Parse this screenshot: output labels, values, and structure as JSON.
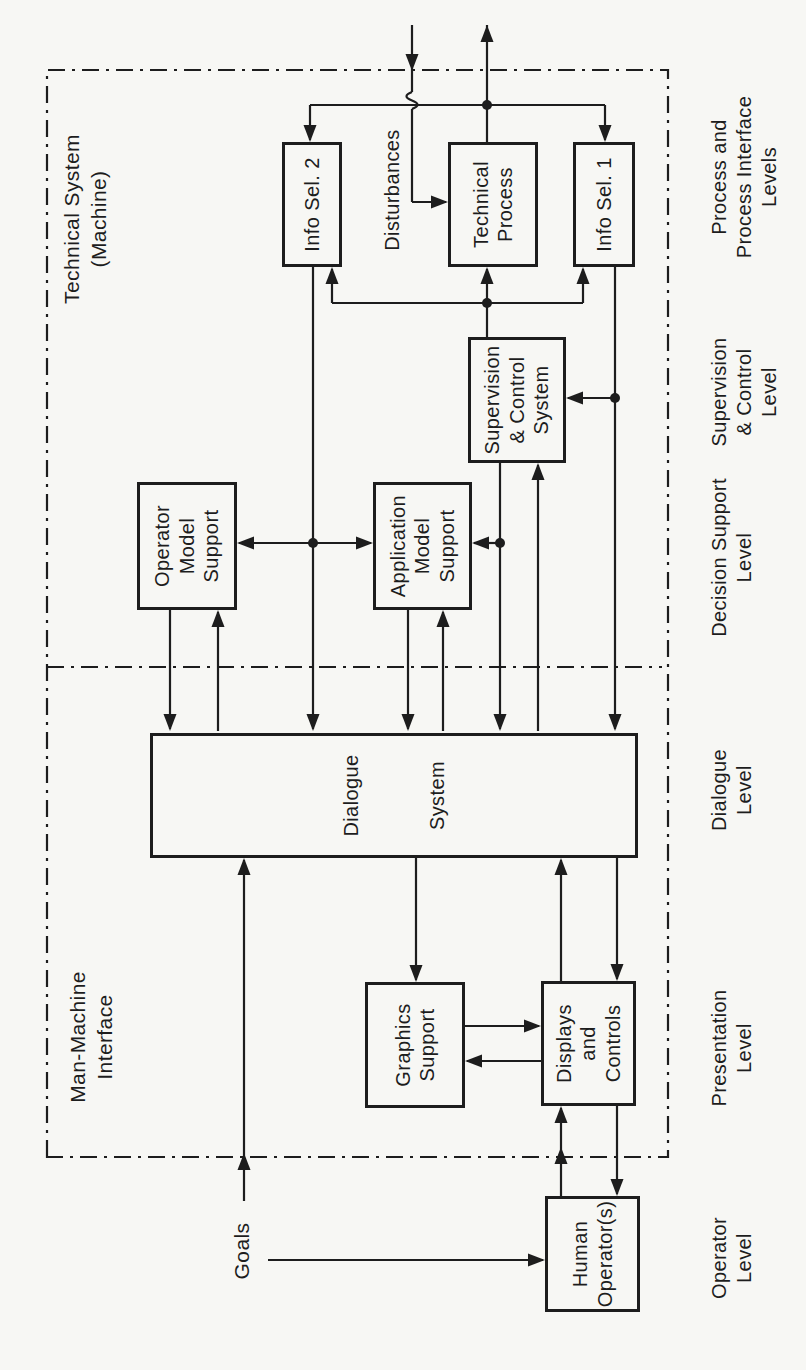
{
  "diagram": {
    "title_regions": {
      "man_machine_interface": {
        "lines": [
          "Man-Machine",
          "Interface"
        ]
      },
      "technical_system": {
        "lines": [
          "Technical  System",
          "(Machine)"
        ]
      }
    },
    "external_labels": {
      "goals": "Goals",
      "disturbances": "Disturbances"
    },
    "boxes": {
      "human_operator": {
        "lines": [
          "Human",
          "Operator(s)"
        ]
      },
      "displays_controls": {
        "lines": [
          "Displays",
          "and",
          "Controls"
        ]
      },
      "graphics_support": {
        "lines": [
          "Graphics",
          "Support"
        ]
      },
      "dialogue_system": {
        "lines": [
          "Dialogue",
          "System"
        ]
      },
      "operator_model": {
        "lines": [
          "Operator",
          "Model",
          "Support"
        ]
      },
      "application_model": {
        "lines": [
          "Application",
          "Model",
          "Support"
        ]
      },
      "supervision_control": {
        "lines": [
          "Supervision",
          "& Control",
          "System"
        ]
      },
      "info_sel_2": {
        "lines": [
          "Info Sel. 2"
        ]
      },
      "technical_process": {
        "lines": [
          "Technical",
          "Process"
        ]
      },
      "info_sel_1": {
        "lines": [
          "Info Sel. 1"
        ]
      }
    },
    "levels": [
      {
        "id": "operator-level",
        "lines": [
          "Operator",
          "Level"
        ]
      },
      {
        "id": "presentation-level",
        "lines": [
          "Presentation",
          "Level"
        ]
      },
      {
        "id": "dialogue-level",
        "lines": [
          "Dialogue",
          "Level"
        ]
      },
      {
        "id": "decision-support-level",
        "lines": [
          "Decision  Support",
          "Level"
        ]
      },
      {
        "id": "supervision-control-level",
        "lines": [
          "Supervision",
          "& Control",
          "Level"
        ]
      },
      {
        "id": "process-interface-level",
        "lines": [
          "Process and",
          "Process  Interface",
          "Levels"
        ]
      }
    ],
    "colors": {
      "ink": "#1d1d1d",
      "paper": "#f7f7f4"
    }
  }
}
